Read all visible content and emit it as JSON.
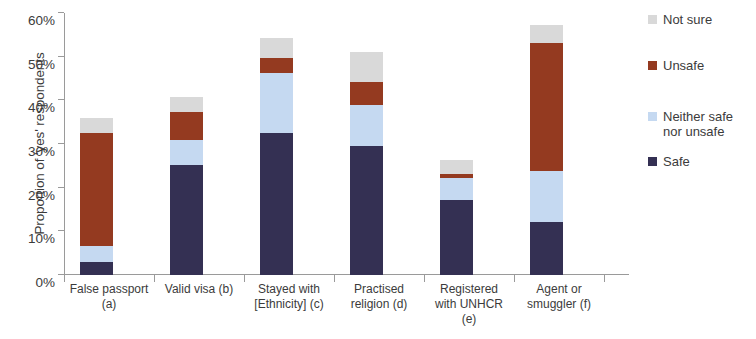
{
  "chart_data": {
    "type": "bar",
    "stacked": true,
    "title": "",
    "subtitle": "",
    "xlabel": "",
    "ylabel": "Proportion of 'yes' respondents",
    "ylim": [
      0,
      60
    ],
    "ytick_values": [
      0,
      10,
      20,
      30,
      40,
      50,
      60
    ],
    "ytick_labels": [
      "0%",
      "10%",
      "20%",
      "30%",
      "40%",
      "50%",
      "60%"
    ],
    "grid": false,
    "legend_position": "right",
    "unit": "%",
    "categories": [
      "False passport (a)",
      "Valid visa (b)",
      "Stayed with [Ethnicity] (c)",
      "Practised religion (d)",
      "Registered with UNHCR (e)",
      "Agent or smuggler (f)"
    ],
    "category_labels": [
      "False passport\n(a)",
      "Valid visa (b)",
      "Stayed with\n[Ethnicity] (c)",
      "Practised\nreligion (d)",
      "Registered\nwith UNHCR\n(e)",
      "Agent or\nsmuggler (f)"
    ],
    "series": [
      {
        "name": "Safe",
        "color": "#343053",
        "values": [
          3.0,
          25.3,
          32.5,
          29.5,
          17.2,
          12.2
        ]
      },
      {
        "name": "Neither safe nor unsafe",
        "color": "#c5d9f1",
        "values": [
          3.6,
          5.7,
          13.7,
          9.4,
          5.0,
          11.7
        ]
      },
      {
        "name": "Unsafe",
        "color": "#943a20",
        "values": [
          25.9,
          6.4,
          3.4,
          5.3,
          0.9,
          29.3
        ]
      },
      {
        "name": "Not sure",
        "color": "#d9d9d9",
        "values": [
          3.4,
          3.3,
          4.6,
          6.9,
          3.2,
          4.1
        ]
      }
    ],
    "totals": [
      35.9,
      40.7,
      54.2,
      51.1,
      26.3,
      57.3
    ]
  },
  "legend": {
    "items": [
      {
        "label": "Not sure",
        "color": "#d9d9d9"
      },
      {
        "label": "Unsafe",
        "color": "#943a20"
      },
      {
        "label": "Neither safe\nnor unsafe",
        "color": "#c5d9f1"
      },
      {
        "label": "Safe",
        "color": "#343053"
      }
    ]
  },
  "axis": {
    "y_title": "Proportion of 'yes' respondents"
  }
}
